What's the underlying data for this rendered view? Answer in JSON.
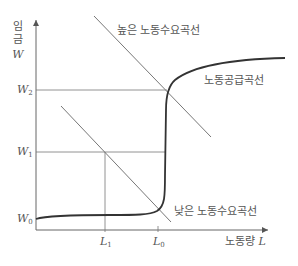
{
  "diagram": {
    "y_axis": {
      "label_korean": "임금",
      "label_chars": [
        "임",
        "금"
      ],
      "symbol": "W"
    },
    "x_axis": {
      "label_korean": "노동량",
      "symbol": "L"
    },
    "y_ticks": [
      {
        "base": "W",
        "sub": "2"
      },
      {
        "base": "W",
        "sub": "1"
      },
      {
        "base": "W",
        "sub": "0"
      }
    ],
    "x_ticks": [
      {
        "base": "L",
        "sub": "1"
      },
      {
        "base": "L",
        "sub": "0"
      }
    ],
    "curves": {
      "high_demand": "높은 노동수요곡선",
      "supply": "노동공급곡선",
      "low_demand": "낮은 노동수요곡선"
    },
    "colors": {
      "axis": "#555555",
      "demand": "#666666",
      "supply": "#333333",
      "guide": "#666666"
    }
  }
}
